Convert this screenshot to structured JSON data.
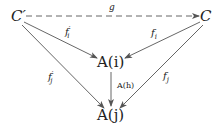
{
  "diagram": {
    "type": "commutative-diagram",
    "nodes": {
      "c_prime": "C′",
      "c": "C",
      "a_i": "A(i)",
      "a_j": "A(j)"
    },
    "edges": {
      "g": {
        "label": "g",
        "from": "C′",
        "to": "C",
        "style": "dashed"
      },
      "f_prime_i": {
        "label": "f′ᵢ",
        "base": "f",
        "sup": "′",
        "sub": "i",
        "from": "C′",
        "to": "A(i)"
      },
      "f_i": {
        "label": "fᵢ",
        "base": "f",
        "sub": "i",
        "from": "C",
        "to": "A(i)"
      },
      "f_prime_j": {
        "label": "f′ⱼ",
        "base": "f",
        "sup": "′",
        "sub": "j",
        "from": "C′",
        "to": "A(j)"
      },
      "f_j": {
        "label": "fⱼ",
        "base": "f",
        "sub": "j",
        "from": "C",
        "to": "A(j)"
      },
      "a_h": {
        "label": "A(h)",
        "from": "A(i)",
        "to": "A(j)"
      }
    },
    "colors": {
      "stroke": "#555555",
      "text": "#222222"
    }
  }
}
